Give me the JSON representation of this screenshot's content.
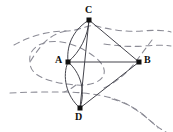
{
  "figure": {
    "kind": "graph-embedding-diagram",
    "width": 173,
    "height": 132,
    "background": "#ffffff",
    "edge_color": "#3a3a42",
    "contour_color": "#8c8c96",
    "node_color": "#111111",
    "label_color": "#101010"
  },
  "nodes": [
    {
      "id": "C",
      "label": "C",
      "x": 89,
      "y": 20,
      "label_x": 85,
      "label_y": 6
    },
    {
      "id": "A",
      "label": "A",
      "x": 68,
      "y": 62,
      "label_x": 55,
      "label_y": 56
    },
    {
      "id": "B",
      "label": "B",
      "x": 139,
      "y": 62,
      "label_x": 144,
      "label_y": 56
    },
    {
      "id": "D",
      "label": "D",
      "x": 80,
      "y": 108,
      "label_x": 75,
      "label_y": 112
    }
  ],
  "edges": [
    {
      "from": "C",
      "to": "B",
      "style": "straight"
    },
    {
      "from": "B",
      "to": "D",
      "style": "straight"
    },
    {
      "from": "C",
      "to": "D",
      "style": "straight"
    },
    {
      "from": "A",
      "to": "B",
      "style": "straight"
    },
    {
      "from": "C",
      "to": "A",
      "style": "curved-left"
    },
    {
      "from": "C",
      "to": "A",
      "style": "curved-right"
    },
    {
      "from": "A",
      "to": "D",
      "style": "curved-left"
    },
    {
      "from": "A",
      "to": "D",
      "style": "curved-right"
    }
  ],
  "contours": [
    {
      "name": "upper-band",
      "style": "dashed"
    },
    {
      "name": "upper-branch",
      "style": "dashed"
    },
    {
      "name": "inner-blob-around-A",
      "style": "dashed"
    },
    {
      "name": "lower-band",
      "style": "dashed"
    },
    {
      "name": "lower-branch",
      "style": "dashed"
    }
  ]
}
